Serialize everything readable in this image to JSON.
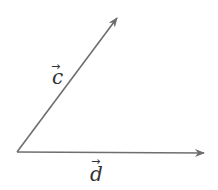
{
  "diagram": {
    "type": "vectors",
    "colors": {
      "line": "#6e6e6e",
      "text": "#333333",
      "background": "#ffffff"
    },
    "origin": [
      17,
      152
    ],
    "vectors": [
      {
        "id": "c",
        "label": "c",
        "arrow_mark": "→",
        "tip": [
          117,
          18
        ],
        "label_pos": [
          50,
          84
        ]
      },
      {
        "id": "d",
        "label": "d",
        "arrow_mark": "→",
        "tip": [
          204,
          153
        ],
        "label_pos": [
          90,
          180
        ]
      }
    ]
  }
}
